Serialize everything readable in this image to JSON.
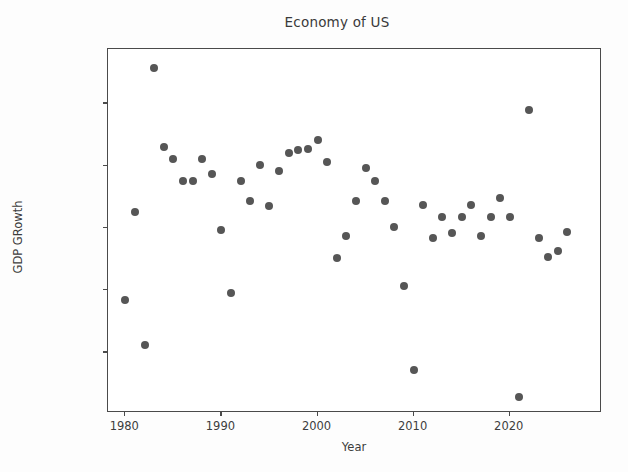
{
  "chart_data": {
    "type": "scatter",
    "title": "Economy of US",
    "xlabel": "Year",
    "ylabel": "GDP GRowth",
    "grid": false,
    "legend": null,
    "marker": {
      "shape": "circle",
      "color": "#565656",
      "size": 8
    },
    "xlim": [
      1978.2,
      1979.6
    ],
    "xlim_actual": [
      1978.2,
      2029.6
    ],
    "ylim": [
      -0.0395,
      0.0775
    ],
    "xticks": [
      1980,
      1990,
      2000,
      2010,
      2020
    ],
    "xtick_labels": [
      "1980",
      "1990",
      "2000",
      "2010",
      "2020"
    ],
    "yticks": [
      -0.02,
      0.0,
      0.02,
      0.04,
      0.06
    ],
    "ytick_labels": [
      "−0.02",
      "0.00",
      "0.02",
      "0.04",
      "0.06"
    ],
    "x": [
      1980,
      1981,
      1982,
      1983,
      1984,
      1985,
      1986,
      1987,
      1988,
      1990,
      1991,
      1992,
      1993,
      1994,
      1995,
      1996,
      1997,
      1998,
      1999,
      2000,
      2001,
      2002,
      2003,
      2004,
      2005,
      2006,
      2007,
      2008,
      2009,
      2010,
      2011,
      2012,
      2013,
      2014,
      2015,
      2016,
      2017,
      2018,
      2019,
      2020,
      2021,
      2022,
      2023,
      2024,
      2025,
      2026,
      2027
    ],
    "y": [
      -0.0033,
      0.0251,
      -0.0177,
      0.0715,
      0.0461,
      0.0421,
      0.0352,
      0.0351,
      0.0421,
      0.0372,
      0.0192,
      -0.0008,
      0.0352,
      0.0285,
      0.0403,
      0.0271,
      0.0382,
      0.0442,
      0.0449,
      0.0453,
      0.0484,
      0.0412,
      0.0104,
      0.0174,
      0.0285,
      0.0391,
      0.0352,
      0.0285,
      0.0203,
      0.0013,
      -0.0258,
      0.0274,
      0.0166,
      0.0235,
      0.0184,
      0.0236,
      0.0274,
      0.0175,
      0.0235,
      0.0297,
      0.0235,
      -0.0345,
      0.0578,
      0.0166,
      0.0108,
      0.0125,
      0.0186
    ],
    "points": [
      {
        "year": 1980,
        "value": -0.0033
      },
      {
        "year": 1981,
        "value": 0.0251
      },
      {
        "year": 1982,
        "value": -0.0177
      },
      {
        "year": 1983,
        "value": 0.0715
      },
      {
        "year": 1984,
        "value": 0.0461
      },
      {
        "year": 1985,
        "value": 0.0421
      },
      {
        "year": 1986,
        "value": 0.0352
      },
      {
        "year": 1987,
        "value": 0.0351
      },
      {
        "year": 1988,
        "value": 0.0421
      },
      {
        "year": 1989,
        "value": 0.0372
      },
      {
        "year": 1990,
        "value": 0.0192
      },
      {
        "year": 1991,
        "value": -0.0008
      },
      {
        "year": 1992,
        "value": 0.0352
      },
      {
        "year": 1993,
        "value": 0.0285
      },
      {
        "year": 1994,
        "value": 0.0403
      },
      {
        "year": 1995,
        "value": 0.0271
      },
      {
        "year": 1996,
        "value": 0.0382
      },
      {
        "year": 1997,
        "value": 0.0442
      },
      {
        "year": 1998,
        "value": 0.0449
      },
      {
        "year": 1999,
        "value": 0.0453
      },
      {
        "year": 2000,
        "value": 0.0484
      },
      {
        "year": 2001,
        "value": 0.0412
      },
      {
        "year": 2002,
        "value": 0.0104
      },
      {
        "year": 2003,
        "value": 0.0174
      },
      {
        "year": 2004,
        "value": 0.0285
      },
      {
        "year": 2005,
        "value": 0.0391
      },
      {
        "year": 2006,
        "value": 0.0352
      },
      {
        "year": 2007,
        "value": 0.0285
      },
      {
        "year": 2008,
        "value": 0.0203
      },
      {
        "year": 2009,
        "value": 0.0013
      },
      {
        "year": 2010,
        "value": -0.0258
      },
      {
        "year": 2011,
        "value": 0.0274
      },
      {
        "year": 2012,
        "value": 0.0166
      },
      {
        "year": 2013,
        "value": 0.0235
      },
      {
        "year": 2014,
        "value": 0.0184
      },
      {
        "year": 2015,
        "value": 0.0236
      },
      {
        "year": 2016,
        "value": 0.0274
      },
      {
        "year": 2017,
        "value": 0.0175
      },
      {
        "year": 2018,
        "value": 0.0235
      },
      {
        "year": 2019,
        "value": 0.0297
      },
      {
        "year": 2020,
        "value": 0.0235
      },
      {
        "year": 2021,
        "value": -0.0345
      },
      {
        "year": 2022,
        "value": 0.0578
      },
      {
        "year": 2023,
        "value": 0.0166
      },
      {
        "year": 2024,
        "value": 0.0108
      },
      {
        "year": 2025,
        "value": 0.0125
      },
      {
        "year": 2026,
        "value": 0.0186
      }
    ]
  }
}
